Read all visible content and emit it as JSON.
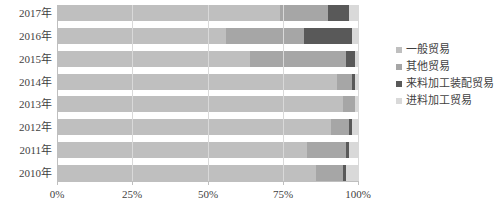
{
  "chart_data": {
    "type": "bar",
    "title": "",
    "subtitle": "",
    "xlabel": "",
    "ylabel": "",
    "orientation": "horizontal",
    "stacked": "100%",
    "grid": true,
    "legend_position": "right",
    "xlim": [
      0,
      100
    ],
    "xticks": [
      "0%",
      "25%",
      "50%",
      "75%",
      "100%"
    ],
    "xtick_values": [
      0,
      25,
      50,
      75,
      100
    ],
    "categories": [
      "2017年",
      "2016年",
      "2015年",
      "2014年",
      "2013年",
      "2012年",
      "2011年",
      "2010年"
    ],
    "series": [
      {
        "name": "一般贸易",
        "color": "#bfbfbf",
        "values": [
          74,
          56,
          64,
          93,
          95,
          91,
          83,
          86
        ]
      },
      {
        "name": "其他贸易",
        "color": "#a6a6a6",
        "values": [
          16,
          26,
          32,
          5,
          4,
          6,
          13,
          9
        ]
      },
      {
        "name": "来料加工装配贸易",
        "color": "#595959",
        "values": [
          7,
          16,
          3,
          1,
          0,
          1,
          1,
          1
        ]
      },
      {
        "name": "进料加工贸易",
        "color": "#d9d9d9",
        "values": [
          3,
          2,
          1,
          1,
          1,
          2,
          3,
          4
        ]
      }
    ]
  }
}
